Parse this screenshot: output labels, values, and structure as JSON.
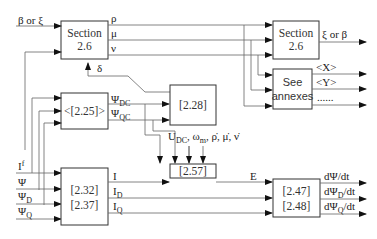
{
  "diagram": {
    "inputs_top": "β or ξ",
    "section_in": {
      "line1": "Section",
      "line2": "2.6"
    },
    "section_out": {
      "line1": "Section",
      "line2": "2.6"
    },
    "section_out_output": "ξ or β",
    "section_in_outputs": [
      "ρ",
      "μ",
      "ν"
    ],
    "feedback_delta": "δ",
    "annexes": {
      "line1": "See",
      "line2": "annexes"
    },
    "annex_outputs": [
      "<X>",
      "<Y>",
      "......"
    ],
    "block_225": "<[2.25]>",
    "psi_dc": "Ψ",
    "psi_dc_sub": "DC",
    "psi_qc": "Ψ",
    "psi_qc_sub": "QC",
    "block_228": "[2.28]",
    "aux_inputs": {
      "u": "U",
      "u_sub": "DC",
      "omega": "ω",
      "omega_sub": "m",
      "rest": ", ρ̇, μ̇, ν̇"
    },
    "left_inputs": [
      {
        "main": "I",
        "sup": "f"
      },
      {
        "main": "Ψ",
        "sub": ""
      },
      {
        "main": "Ψ",
        "sub": "D"
      },
      {
        "main": "Ψ",
        "sub": "Q"
      }
    ],
    "block_232": {
      "line1": "[2.32]",
      "line2": "[2.37]"
    },
    "currents": [
      {
        "main": "I",
        "sub": ""
      },
      {
        "main": "I",
        "sub": "D"
      },
      {
        "main": "I",
        "sub": "Q"
      }
    ],
    "block_257": "[2.57]",
    "e_label": "E",
    "block_247": {
      "line1": "[2.47]",
      "line2": "[2.48]"
    },
    "final_outputs": [
      {
        "pre": "dΨ",
        "sub": "",
        "post": "/dt"
      },
      {
        "pre": "dΨ",
        "sub": "D",
        "post": "/dt"
      },
      {
        "pre": "dΨ",
        "sub": "Q",
        "post": "/dt"
      }
    ]
  }
}
